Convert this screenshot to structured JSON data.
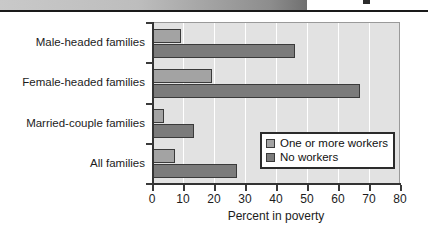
{
  "header": {
    "gradient_bar_name": "page-header-band",
    "accent_dark": "#1a1a1a"
  },
  "chart_data": {
    "type": "bar",
    "orientation": "horizontal",
    "title": "",
    "xlabel": "Percent in poverty",
    "ylabel": "",
    "xlim": [
      0,
      80
    ],
    "xticks": [
      0,
      10,
      20,
      30,
      40,
      50,
      60,
      70,
      80
    ],
    "grid": "vertical",
    "legend_position": "inside-lower-right",
    "categories": [
      "Male-headed families",
      "Female-headed families",
      "Married-couple families",
      "All families"
    ],
    "series": [
      {
        "name": "One or more workers",
        "color": "#a3a3a3",
        "values": [
          9.3,
          19.5,
          4.0,
          7.5
        ]
      },
      {
        "name": "No workers",
        "color": "#7b7b7b",
        "values": [
          46.0,
          67.0,
          13.5,
          27.5
        ]
      }
    ]
  }
}
